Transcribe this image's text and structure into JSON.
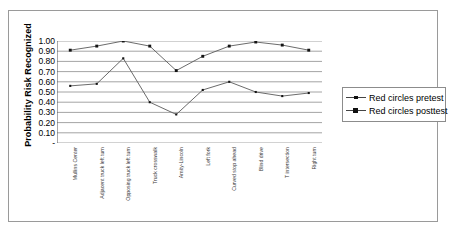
{
  "chart_data": {
    "type": "line",
    "title": "",
    "xlabel": "",
    "ylabel": "Probability Risk Recognized",
    "ylim": [
      0,
      1.0
    ],
    "ytick_labels": [
      "1.00",
      "0.90",
      "0.80",
      "0.70",
      "0.60",
      "0.50",
      "0.40",
      "0.30",
      "0.20",
      "0.10",
      "-"
    ],
    "ytick_values": [
      1.0,
      0.9,
      0.8,
      0.7,
      0.6,
      0.5,
      0.4,
      0.3,
      0.2,
      0.1,
      0.0
    ],
    "grid": "horizontal",
    "legend_position": "right",
    "categories": [
      "Mullins Center",
      "Adjacent truck left turn",
      "Opposing truck left turn",
      "Truck crosswalk",
      "Amity-Lincoln",
      "Left fork",
      "Curved stop ahead",
      "Blind drive",
      "T intersection",
      "Right turn"
    ],
    "series": [
      {
        "name": "Red circles pretest",
        "marker": "small-square",
        "values": [
          0.56,
          0.58,
          0.83,
          0.4,
          0.28,
          0.52,
          0.6,
          0.5,
          0.46,
          0.49
        ]
      },
      {
        "name": "Red circles posttest",
        "marker": "square",
        "values": [
          0.91,
          0.95,
          1.0,
          0.95,
          0.71,
          0.85,
          0.95,
          0.99,
          0.96,
          0.91
        ]
      }
    ]
  },
  "legend": {
    "items": [
      {
        "label": "Red circles pretest"
      },
      {
        "label": "Red circles posttest"
      }
    ]
  }
}
